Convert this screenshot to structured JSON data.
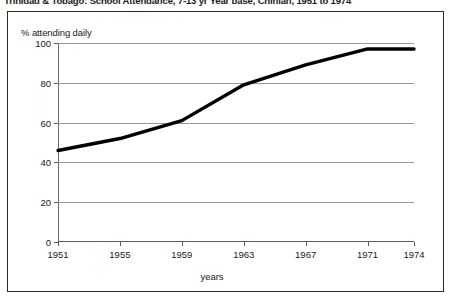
{
  "title": "Trinidad & Tobago: School Attendance, 7-13 yr Year base, Chinian, 1951 to 1974",
  "axis": {
    "y_label": "% attending daily",
    "x_label": "years"
  },
  "colors": {
    "line": "#000000",
    "grid": "#9a9a9a",
    "axis": "#5a5a5a",
    "frame": "#2b2b2b",
    "text": "#1a1a1a",
    "background": "#ffffff"
  },
  "chart_data": {
    "type": "line",
    "title": "Trinidad & Tobago: School Attendance, 7-13 yr Year base, Chinian, 1951 to 1974",
    "xlabel": "years",
    "ylabel": "% attending daily",
    "ylim": [
      0,
      100
    ],
    "yticks": [
      0,
      20,
      40,
      60,
      80,
      100
    ],
    "xticks": [
      1951,
      1955,
      1959,
      1963,
      1967,
      1971,
      1974
    ],
    "xlim": [
      1951,
      1974
    ],
    "grid": true,
    "legend": false,
    "x": [
      1951,
      1955,
      1959,
      1963,
      1967,
      1971,
      1974
    ],
    "values": [
      46,
      52,
      61,
      79,
      89,
      97,
      97
    ],
    "series": [
      {
        "name": "% attending daily",
        "values": [
          46,
          52,
          61,
          79,
          89,
          97,
          97
        ]
      }
    ]
  }
}
